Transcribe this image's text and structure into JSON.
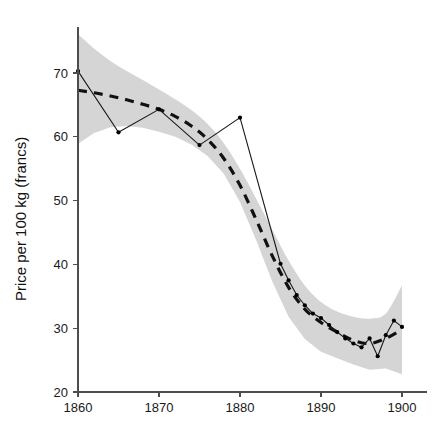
{
  "chart_data": {
    "type": "line",
    "title": "",
    "subtitle": "",
    "xlabel": "",
    "ylabel": "Price per 100 kg (francs)",
    "xlim": [
      1858,
      1901.5
    ],
    "ylim": [
      20,
      75
    ],
    "grid": false,
    "legend": "none",
    "x_ticks": [
      1860,
      1870,
      1880,
      1890,
      1900
    ],
    "x_tick_labels": [
      "1860",
      "1870",
      "1880",
      "1890",
      "1900"
    ],
    "y_ticks": [
      20,
      30,
      40,
      50,
      60,
      70
    ],
    "y_tick_labels": [
      "20",
      "30",
      "40",
      "50",
      "60",
      "70"
    ],
    "series": [
      {
        "name": "observed-price",
        "style": "solid-with-markers",
        "color": "#1a1a1a",
        "x": [
          1860,
          1865,
          1870,
          1875,
          1880,
          1885,
          1886,
          1887,
          1888,
          1889,
          1890,
          1891,
          1892,
          1893,
          1894,
          1895,
          1896,
          1897,
          1898,
          1899,
          1900
        ],
        "values": [
          70.3,
          60.7,
          64.3,
          58.7,
          63.0,
          40.1,
          37.5,
          35.2,
          33.6,
          32.3,
          31.6,
          30.5,
          29.4,
          28.4,
          27.6,
          27.0,
          28.4,
          25.6,
          28.9,
          31.2,
          30.2
        ]
      },
      {
        "name": "smoothed-trend",
        "style": "dashed",
        "color": "#111111",
        "x": [
          1860,
          1862,
          1864,
          1866,
          1868,
          1870,
          1872,
          1874,
          1876,
          1878,
          1880,
          1882,
          1884,
          1886,
          1888,
          1890,
          1892,
          1894,
          1896,
          1898,
          1900
        ],
        "values": [
          67.3,
          66.9,
          66.4,
          65.8,
          65.1,
          64.3,
          63.2,
          61.7,
          59.6,
          56.6,
          52.4,
          47.0,
          41.3,
          36.4,
          33.0,
          30.9,
          29.4,
          28.1,
          27.6,
          28.4,
          29.8
        ]
      }
    ],
    "confidence_band": {
      "name": "confidence-interval",
      "color": "#d5d5d5",
      "x": [
        1860,
        1862,
        1864,
        1866,
        1868,
        1870,
        1872,
        1874,
        1876,
        1878,
        1880,
        1882,
        1884,
        1886,
        1888,
        1890,
        1892,
        1894,
        1896,
        1898,
        1900
      ],
      "upper": [
        76.1,
        73.8,
        71.9,
        70.3,
        68.9,
        67.4,
        65.9,
        64.2,
        62.0,
        59.0,
        55.0,
        50.3,
        45.4,
        40.6,
        36.7,
        34.1,
        32.6,
        31.8,
        31.5,
        32.3,
        36.7
      ],
      "lower": [
        58.9,
        60.6,
        61.5,
        61.7,
        61.4,
        60.8,
        60.0,
        58.8,
        57.0,
        54.2,
        49.8,
        43.8,
        37.3,
        31.8,
        28.3,
        26.3,
        25.3,
        24.3,
        23.5,
        23.7,
        22.8
      ]
    }
  }
}
